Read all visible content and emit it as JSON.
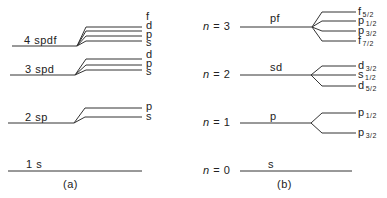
{
  "panel_a": {
    "caption": "(a)",
    "levels": [
      {
        "label": "4 spdf",
        "sublevels": [
          "f",
          "d",
          "p",
          "s"
        ]
      },
      {
        "label": "3 spd",
        "sublevels": [
          "d",
          "p",
          "s"
        ]
      },
      {
        "label": "2 sp",
        "sublevels": [
          "p",
          "s"
        ]
      },
      {
        "label": "1 s",
        "sublevels": []
      }
    ]
  },
  "panel_b": {
    "caption": "(b)",
    "levels": [
      {
        "n_label": "n",
        "n_value": "= 3",
        "orbital": "pf",
        "sublevels": [
          {
            "letter": "f",
            "j": "5/2"
          },
          {
            "letter": "p",
            "j": "1/2"
          },
          {
            "letter": "p",
            "j": "3/2"
          },
          {
            "letter": "f",
            "j": "7/2"
          }
        ]
      },
      {
        "n_label": "n",
        "n_value": "= 2",
        "orbital": "sd",
        "sublevels": [
          {
            "letter": "d",
            "j": "3/2"
          },
          {
            "letter": "s",
            "j": "1/2"
          },
          {
            "letter": "d",
            "j": "5/2"
          }
        ]
      },
      {
        "n_label": "n",
        "n_value": "= 1",
        "orbital": "p",
        "sublevels": [
          {
            "letter": "p",
            "j": "1/2"
          },
          {
            "letter": "p",
            "j": "3/2"
          }
        ]
      },
      {
        "n_label": "n",
        "n_value": "= 0",
        "orbital": "s",
        "sublevels": []
      }
    ]
  }
}
